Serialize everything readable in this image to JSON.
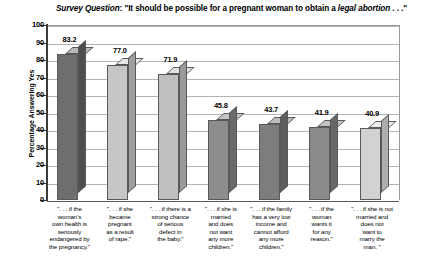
{
  "chart_data": {
    "type": "bar",
    "title": "Survey Question: \"It should be possible for a pregnant woman to obtain a legal abortion . . .\"",
    "title_parts": {
      "label": "Survey Question",
      "colon": ": ",
      "text": "\"It should be possible for a pregnant woman to obtain a ",
      "emphasis": "legal abortion",
      "tail": " . . .\""
    },
    "xlabel": "",
    "ylabel": "Percentage Answering Yes",
    "ylim": [
      0,
      100
    ],
    "ytick_step": 10,
    "yticks": [
      "100",
      "90",
      "80",
      "70",
      "60",
      "50",
      "40",
      "30",
      "20",
      "10",
      "0"
    ],
    "grid": true,
    "legend": "none",
    "categories": [
      "\". . . if the woman's own health is seriously endangered by the pregnancy.\"",
      "\". . . if she became pregnant as a result of rape.\"",
      "\". . . if there is a strong chance of serious defect in the baby.\"",
      "\". . . if she is married and does not want any more children.\"",
      "\". . . if the family has a very low income and cannot afford any more children.\"",
      "\". . . if the woman wants it for any reason.\"",
      "\". . . if she is not married and does not want to marry the man.\""
    ],
    "category_lines": [
      [
        "\". . . if the",
        "woman's",
        "own health is",
        "seriously",
        "endangered by",
        "the pregnancy.\""
      ],
      [
        "\". . . if she",
        "became",
        "pregnant",
        "as a result",
        "of rape.\""
      ],
      [
        "\". . . if there is a",
        "strong chance",
        "of serious",
        "defect in",
        "the baby.\""
      ],
      [
        "\". . . if she is",
        "married",
        "and does",
        "not want",
        "any more",
        "children.\""
      ],
      [
        "\". . . if the family",
        "has a very low",
        "income and",
        "cannot afford",
        "any more",
        "children.\""
      ],
      [
        "\". . . if the",
        "woman",
        "wants it",
        "for any",
        "reason.\""
      ],
      [
        "\". . . if she is not",
        "married and",
        "does not",
        "want to",
        "marry the",
        "man. \""
      ]
    ],
    "values": [
      83.2,
      77.0,
      71.9,
      45.8,
      43.7,
      41.9,
      40.9
    ],
    "value_labels": [
      "83.2",
      "77.0",
      "71.9",
      "45.8",
      "43.7",
      "41.9",
      "40.9"
    ],
    "bar_colors": [
      "#6e6e6e",
      "#c6c6c6",
      "#c0c0c0",
      "#8d8d8d",
      "#7d7d7d",
      "#8a8a8a",
      "#d2d2d2"
    ],
    "bar_top_colors": [
      "#b9b9b9",
      "#e6e6e6",
      "#e2e2e2",
      "#c4c4c4",
      "#bdbdbd",
      "#c2c2c2",
      "#ebebeb"
    ],
    "bar_side_colors": [
      "#4e4e4e",
      "#9e9e9e",
      "#9a9a9a",
      "#6a6a6a",
      "#5e5e5e",
      "#676767",
      "#aeaeae"
    ],
    "colors": {
      "axis": "#3a3a3a",
      "gridline": "#b4b4b4",
      "border": "#9a9a9a",
      "text": "#000000",
      "background": "#ffffff"
    }
  }
}
